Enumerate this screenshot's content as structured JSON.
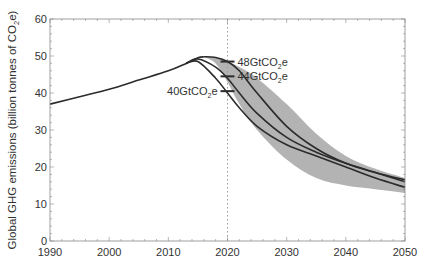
{
  "chart_data": {
    "type": "area",
    "title": "",
    "xlabel": "",
    "ylabel": "Global GHG emissions (billion tonnes of CO2e)",
    "ylabel_parts": {
      "pre": "Global GHG emissions (billion tonnes of CO",
      "sub": "2",
      "post": "e)"
    },
    "xlim": [
      1990,
      2050
    ],
    "ylim": [
      0,
      60
    ],
    "xticks": [
      1990,
      2000,
      2010,
      2020,
      2030,
      2040,
      2050
    ],
    "yticks": [
      0,
      10,
      20,
      30,
      40,
      50,
      60
    ],
    "grid": false,
    "vline": {
      "x": 2020,
      "style": "dotted"
    },
    "historical": {
      "name": "Historical emissions",
      "x": [
        1990,
        1995,
        2000,
        2005,
        2010,
        2013,
        2015,
        2016
      ],
      "values": [
        37,
        39,
        41,
        43.5,
        46,
        48,
        49.5,
        49.8
      ]
    },
    "band": {
      "name": "Range",
      "x": [
        2016,
        2018,
        2020,
        2022,
        2025,
        2030,
        2035,
        2040,
        2045,
        2050
      ],
      "upper": [
        49.8,
        49.5,
        48.5,
        47,
        44,
        37,
        29,
        23,
        19.5,
        17
      ],
      "lower": [
        49.8,
        48,
        43,
        37,
        30,
        22,
        17,
        15,
        14,
        13
      ]
    },
    "series": [
      {
        "name": "48GtCO2e pathway",
        "x": [
          2016,
          2018,
          2020,
          2022,
          2025,
          2030,
          2035,
          2040,
          2045,
          2050
        ],
        "values": [
          49.8,
          49.6,
          48.5,
          46,
          40,
          31,
          25,
          21,
          18.5,
          16.5
        ]
      },
      {
        "name": "44GtCO2e pathway",
        "x": [
          2013,
          2015,
          2018,
          2020,
          2022,
          2025,
          2030,
          2035,
          2040,
          2045,
          2050
        ],
        "values": [
          48,
          49.2,
          47,
          44,
          40,
          34.5,
          28,
          24,
          21,
          18.5,
          16
        ]
      },
      {
        "name": "40GtCO2e pathway",
        "x": [
          2013,
          2015,
          2018,
          2020,
          2022,
          2025,
          2030,
          2035,
          2040,
          2045,
          2050
        ],
        "values": [
          48,
          48.5,
          44,
          40,
          36,
          31,
          26,
          23,
          20,
          17,
          14.5
        ]
      }
    ],
    "annotations": [
      {
        "label_pre": "48GtCO",
        "sub": "2",
        "post": "e",
        "x": 2020,
        "y": 48.5,
        "side": "right"
      },
      {
        "label_pre": "44GtCO",
        "sub": "2",
        "post": "e",
        "x": 2020,
        "y": 44.5,
        "side": "right"
      },
      {
        "label_pre": "40GtCO",
        "sub": "2",
        "post": "e",
        "x": 2020,
        "y": 40.5,
        "side": "left"
      }
    ],
    "colors": {
      "line": "#2b2b2b",
      "band": "#b3b3b3",
      "axis": "#888888",
      "vline": "#9a9a9a"
    },
    "legend": null
  }
}
